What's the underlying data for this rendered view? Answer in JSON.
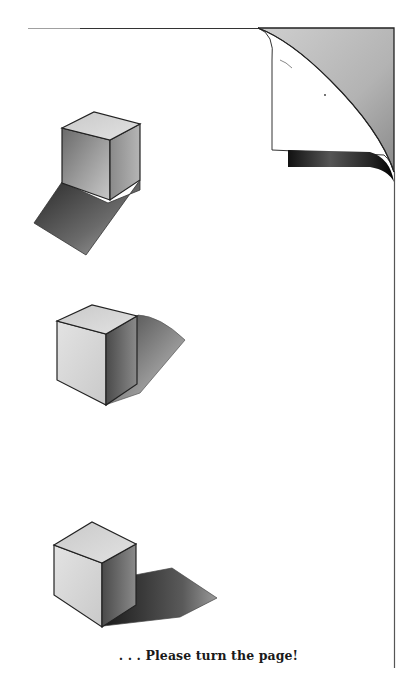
{
  "page": {
    "caption": ". . . Please turn the page!",
    "illustrations": [
      {
        "name": "cube-with-shadow-front-left",
        "shadow_direction": "down-left"
      },
      {
        "name": "cube-with-shadow-right",
        "shadow_direction": "right"
      },
      {
        "name": "cube-with-shadow-bottom-right",
        "shadow_direction": "down-right"
      }
    ],
    "decoration": "page-curl-top-right",
    "colors": {
      "background": "#ffffff",
      "ink": "#1a1a1a",
      "fold_gray": "#b8b8b8"
    }
  }
}
